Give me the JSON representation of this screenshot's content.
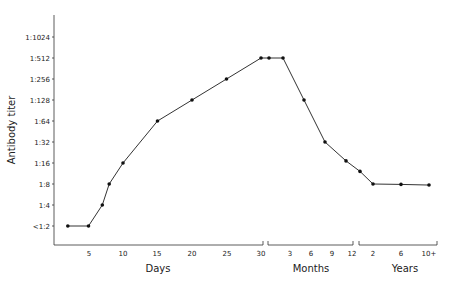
{
  "chart_data": {
    "type": "line",
    "title": "",
    "ylabel": "Antibody titer",
    "y_scale": "log2",
    "y_ticks": [
      "<1:2",
      "1:4",
      "1:8",
      "1:16",
      "1:32",
      "1:64",
      "1:128",
      "1:256",
      "1:512",
      "1:1024"
    ],
    "x_segments": [
      {
        "label": "Days",
        "ticks": [
          "5",
          "10",
          "15",
          "20",
          "25",
          "30"
        ]
      },
      {
        "label": "Months",
        "ticks": [
          "3",
          "6",
          "9",
          "12"
        ]
      },
      {
        "label": "Years",
        "ticks": [
          "2",
          "6",
          "10+"
        ]
      }
    ],
    "grid": false,
    "legend": null,
    "series": [
      {
        "name": "Antibody titer",
        "points": [
          {
            "segment": "Days",
            "x": 2,
            "y": "<1:2",
            "log2": 1
          },
          {
            "segment": "Days",
            "x": 5,
            "y": "<1:2",
            "log2": 1
          },
          {
            "segment": "Days",
            "x": 7,
            "y": "1:4",
            "log2": 2
          },
          {
            "segment": "Days",
            "x": 8,
            "y": "1:8",
            "log2": 3
          },
          {
            "segment": "Days",
            "x": 10,
            "y": "1:16",
            "log2": 4
          },
          {
            "segment": "Days",
            "x": 15,
            "y": "1:64",
            "log2": 6
          },
          {
            "segment": "Days",
            "x": 20,
            "y": "1:128",
            "log2": 7
          },
          {
            "segment": "Days",
            "x": 25,
            "y": "1:256",
            "log2": 8
          },
          {
            "segment": "Days",
            "x": 30,
            "y": "1:512",
            "log2": 9
          },
          {
            "segment": "Months",
            "x": 1,
            "y": "1:512",
            "log2": 9
          },
          {
            "segment": "Months",
            "x": 3,
            "y": "1:512",
            "log2": 9
          },
          {
            "segment": "Months",
            "x": 6,
            "y": "1:128",
            "log2": 7
          },
          {
            "segment": "Months",
            "x": 9,
            "y": "1:32",
            "log2": 5
          },
          {
            "segment": "Months",
            "x": 12,
            "y": "1:16",
            "log2": 4.1
          },
          {
            "segment": "Years",
            "x": 1,
            "y": "1:12",
            "log2": 3.6
          },
          {
            "segment": "Years",
            "x": 2,
            "y": "1:8",
            "log2": 3.0
          },
          {
            "segment": "Years",
            "x": 6,
            "y": "1:8",
            "log2": 2.98
          },
          {
            "segment": "Years",
            "x": 10,
            "y": "1:8",
            "log2": 2.95
          }
        ]
      }
    ]
  },
  "axes": {
    "ylabel": "Antibody titer",
    "xlabels": {
      "days": "Days",
      "months": "Months",
      "years": "Years"
    }
  }
}
